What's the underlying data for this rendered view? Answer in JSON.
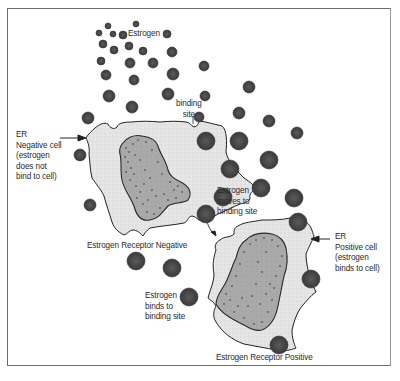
{
  "diagram": {
    "colors": {
      "frame": "#6e6e6e",
      "estrogen_fill": "#4a4a4a",
      "estrogen_stroke": "#333333",
      "cytoplasm_fill": "#e6e6e6",
      "nucleus_fill": "#a8a8a8",
      "outline": "#222222",
      "text": "#2a2a2a"
    },
    "labels": {
      "estrogen": "Estrogen",
      "binding_site": "binding\nsite",
      "er_negative_cell": "ER\nNegative cell\n(estrogen\ndoes not\nbind to cell)",
      "estrogen_receptor_negative": "Estrogen Receptor Negative",
      "estrogen_moves": "Estrogen\nmoves to\nbinding site",
      "er_positive_cell": "ER\nPositive cell\n(estrogen\nbinds to cell)",
      "estrogen_binds": "Estrogen\nbinds to\nbinding site",
      "estrogen_receptor_positive": "Estrogen Receptor Positive"
    },
    "cells": [
      {
        "name": "ER negative cell",
        "type": "negative",
        "binding_sites": 5,
        "bound_estrogen": 0
      },
      {
        "name": "ER positive cell",
        "type": "positive",
        "binding_sites": 5,
        "bound_estrogen": 4
      }
    ],
    "arrows": [
      {
        "from": "ER Negative cell label",
        "to": "negative cell",
        "direction": "right"
      },
      {
        "from": "ER Positive cell label",
        "to": "positive cell",
        "direction": "left"
      },
      {
        "from": "Estrogen moves to binding site label",
        "to": "positive cell binding site",
        "direction": "down"
      }
    ]
  }
}
